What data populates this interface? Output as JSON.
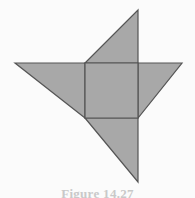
{
  "figure": {
    "label": "Figure 14.27",
    "caption_visible": "partially cut off at bottom edge",
    "background_color": "#fbfbfb",
    "fill_color": "#a8a8a8",
    "stroke_color": "#555555",
    "stroke_width": 1.2,
    "view_box": "0 0 195 198"
  },
  "geometry": {
    "square": {
      "name": "central-square",
      "points": "85,63 138,63 138,118 85,118",
      "left": 85,
      "top": 63,
      "right": 138,
      "bottom": 118,
      "side_length": 54
    },
    "triangles": [
      {
        "name": "top-triangle",
        "points": "85,63 138,10 138,63",
        "apex": [
          138,
          10
        ],
        "position": "top"
      },
      {
        "name": "right-triangle",
        "points": "138,63 182,63 138,118",
        "apex": [
          182,
          63
        ],
        "position": "right"
      },
      {
        "name": "bottom-triangle",
        "points": "85,118 138,118 138,182",
        "apex": [
          138,
          182
        ],
        "position": "bottom"
      },
      {
        "name": "left-triangle",
        "points": "15,63 85,63 85,118",
        "apex": [
          15,
          63
        ],
        "position": "left"
      }
    ]
  }
}
